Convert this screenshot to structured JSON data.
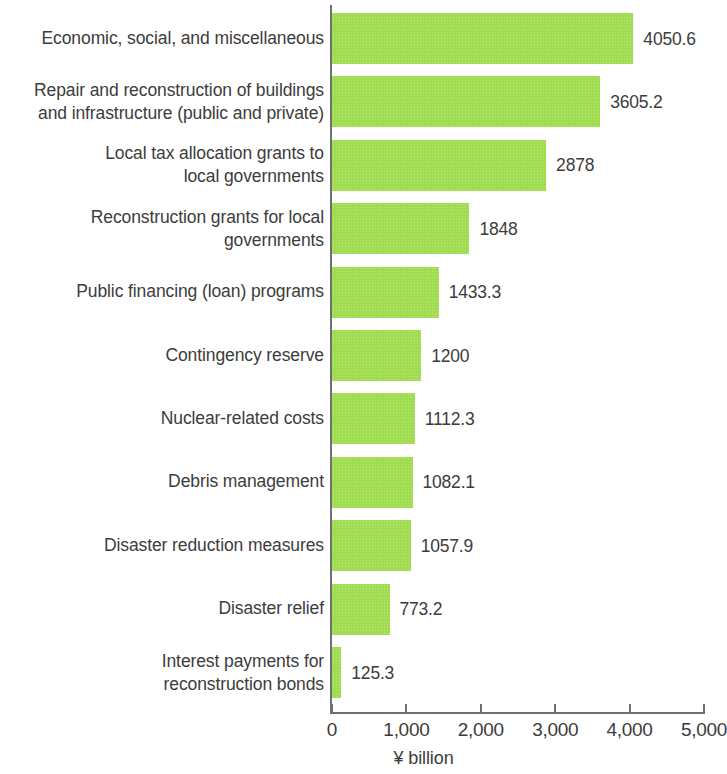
{
  "chart_data": {
    "type": "bar",
    "orientation": "horizontal",
    "title": "",
    "subtitle": "",
    "xlabel": "¥ billion",
    "ylabel": "",
    "xlim": [
      0,
      5000
    ],
    "xticks": [
      0,
      1000,
      2000,
      3000,
      4000,
      5000
    ],
    "xtick_labels": [
      "0",
      "1,000",
      "2,000",
      "3,000",
      "4,000",
      "5,000"
    ],
    "grid": false,
    "legend": null,
    "bar_color": "#9fdc4f",
    "text_color": "#3c3c3c",
    "axis_color": "#6d6f71",
    "categories": [
      "Economic, social, and miscellaneous",
      "Repair and reconstruction of buildings\nand infrastructure (public and private)",
      "Local tax allocation grants to\nlocal governments",
      "Reconstruction grants for local\ngovernments",
      "Public financing (loan) programs",
      "Contingency reserve",
      "Nuclear-related costs",
      "Debris management",
      "Disaster reduction measures",
      "Disaster relief",
      "Interest payments for\nreconstruction bonds"
    ],
    "values": [
      4050.6,
      3605.2,
      2878,
      1848,
      1433.3,
      1200,
      1112.3,
      1082.1,
      1057.9,
      773.2,
      125.3
    ],
    "value_labels": [
      "4050.6",
      "3605.2",
      "2878",
      "1848",
      "1433.3",
      "1200",
      "1112.3",
      "1082.1",
      "1057.9",
      "773.2",
      "125.3"
    ]
  }
}
